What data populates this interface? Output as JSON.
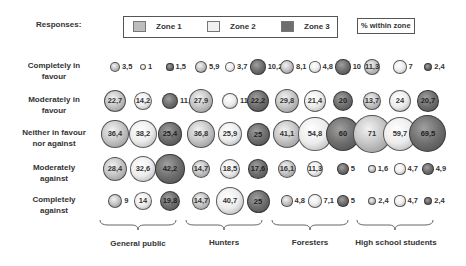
{
  "header": {
    "responses_label": "Responses:",
    "legend": [
      {
        "label": "Zone 1",
        "color": "#bdbdbd"
      },
      {
        "label": "Zone 2",
        "color": "#eeeeee"
      },
      {
        "label": "Zone 3",
        "color": "#6e6e6e"
      }
    ],
    "pct_label": "% within zone"
  },
  "rows": [
    {
      "label_line1": "Completely in",
      "label_line2": "favour"
    },
    {
      "label_line1": "Moderately in",
      "label_line2": "favour"
    },
    {
      "label_line1": "Neither in favour",
      "label_line2": "nor against"
    },
    {
      "label_line1": "Moderately",
      "label_line2": "against"
    },
    {
      "label_line1": "Completely",
      "label_line2": "against"
    }
  ],
  "groups": [
    {
      "label": "General public"
    },
    {
      "label": "Hunters"
    },
    {
      "label": "Foresters"
    },
    {
      "label": "High school students"
    }
  ],
  "chart_data": {
    "type": "bubble",
    "title": "",
    "unit": "% within zone",
    "legend_position": "top",
    "series_names": [
      "Zone 1",
      "Zone 2",
      "Zone 3"
    ],
    "groups": [
      "General public",
      "Hunters",
      "Foresters",
      "High school students"
    ],
    "categories": [
      "Completely in favour",
      "Moderately in favour",
      "Neither in favour nor against",
      "Moderately against",
      "Completely against"
    ],
    "values": {
      "General public": {
        "Zone 1": [
          3.5,
          22.7,
          36.4,
          28.4,
          9
        ],
        "Zone 2": [
          1,
          14.2,
          38.2,
          32.6,
          14
        ],
        "Zone 3": [
          1.5,
          11.1,
          25.4,
          42.2,
          19.8
        ]
      },
      "Hunters": {
        "Zone 1": [
          5.9,
          27.9,
          36.8,
          14.7,
          14.7
        ],
        "Zone 2": [
          3.7,
          11.1,
          25.9,
          18.5,
          40.7
        ],
        "Zone 3": [
          10.2,
          22.2,
          25,
          17.6,
          25
        ]
      },
      "Foresters": {
        "Zone 1": [
          8.1,
          29.8,
          41.1,
          16.1,
          4.8
        ],
        "Zone 2": [
          4.8,
          21.4,
          54.8,
          11.3,
          7.1
        ],
        "Zone 3": [
          10,
          20,
          60,
          5,
          5
        ]
      },
      "High school students": {
        "Zone 1": [
          11.3,
          13.7,
          71,
          1.6,
          2.4
        ],
        "Zone 2": [
          7,
          24,
          59.7,
          4.7,
          4.7
        ],
        "Zone 3": [
          2.4,
          20.7,
          69.5,
          4.9,
          2.4
        ]
      }
    },
    "display_labels": {
      "General public": {
        "Zone 1": [
          "3,5",
          "22,7",
          "36,4",
          "28,4",
          "9"
        ],
        "Zone 2": [
          "1",
          "14,2",
          "38,2",
          "32,6",
          "14"
        ],
        "Zone 3": [
          "1,5",
          "11,1",
          "25,4",
          "42,2",
          "19,8"
        ]
      },
      "Hunters": {
        "Zone 1": [
          "5,9",
          "27,9",
          "36,8",
          "14,7",
          "14,7"
        ],
        "Zone 2": [
          "3,7",
          "11,1",
          "25,9",
          "18,5",
          "40,7"
        ],
        "Zone 3": [
          "10,2",
          "22,2",
          "25",
          "17,6",
          "25"
        ]
      },
      "Foresters": {
        "Zone 1": [
          "8,1",
          "29,8",
          "41,1",
          "16,1",
          "4,8"
        ],
        "Zone 2": [
          "4,8",
          "21,4",
          "54,8",
          "11,3",
          "7,1"
        ],
        "Zone 3": [
          "10",
          "20",
          "60",
          "5",
          "5"
        ]
      },
      "High school students": {
        "Zone 1": [
          "11,3",
          "13,7",
          "71",
          "1,6",
          "2,4"
        ],
        "Zone 2": [
          "7",
          "24",
          "59,7",
          "4,7",
          "4,7"
        ],
        "Zone 3": [
          "2,4",
          "20,7",
          "69,5",
          "4,9",
          "2,4"
        ]
      }
    }
  }
}
